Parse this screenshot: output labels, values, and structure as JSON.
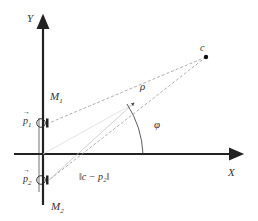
{
  "diagram": {
    "axes": {
      "x_label": "X",
      "y_label": "Y"
    },
    "points": {
      "c_label": "c"
    },
    "mics": [
      {
        "name": "M",
        "index": "1",
        "vector_label": "p",
        "vector_index": "1"
      },
      {
        "name": "M",
        "index": "2",
        "vector_label": "p",
        "vector_index": "2"
      }
    ],
    "annotations": {
      "rho": "ρ",
      "phi": "φ",
      "distance_label": "‖c − p₂‖"
    },
    "colors": {
      "axis": "#222222",
      "dashed": "#999999",
      "text": "#333333"
    }
  }
}
